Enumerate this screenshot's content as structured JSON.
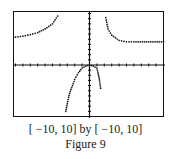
{
  "chart_data": {
    "type": "scatter",
    "title": "",
    "window": {
      "xmin": -10,
      "xmax": 10,
      "ymin": -10,
      "ymax": 10
    },
    "xlabel": "",
    "ylabel": "",
    "x_ticks_per_side": 10,
    "y_ticks_per_side": 10,
    "grid": false,
    "series": [
      {
        "name": "left branch (upper-left)",
        "points": [
          [
            -10,
            5.4
          ],
          [
            -9,
            5.6
          ],
          [
            -8,
            5.9
          ],
          [
            -7,
            6.3
          ],
          [
            -6,
            7.0
          ],
          [
            -5,
            8.0
          ],
          [
            -4.3,
            9.5
          ]
        ]
      },
      {
        "name": "middle branch (downward cap)",
        "points": [
          [
            -3.2,
            -9.0
          ],
          [
            -3,
            -7.5
          ],
          [
            -2.7,
            -5.5
          ],
          [
            -2.3,
            -4.0
          ],
          [
            -2,
            -2.8
          ],
          [
            -1.5,
            -1.5
          ],
          [
            -1,
            -0.6
          ],
          [
            -0.5,
            -0.2
          ],
          [
            0,
            0
          ],
          [
            0.5,
            -0.2
          ],
          [
            1,
            -0.6
          ],
          [
            1.3,
            -2.5
          ],
          [
            1.5,
            -4.5
          ]
        ]
      },
      {
        "name": "right branch (upper-right)",
        "points": [
          [
            2.2,
            9.2
          ],
          [
            2.5,
            7.0
          ],
          [
            3,
            5.8
          ],
          [
            4,
            4.8
          ],
          [
            5,
            4.5
          ],
          [
            6,
            4.5
          ],
          [
            8,
            4.5
          ],
          [
            10,
            4.5
          ]
        ]
      }
    ]
  },
  "caption": {
    "window_label": "[ −10, 10] by [ −10, 10]",
    "figure_label": "Figure 9"
  }
}
